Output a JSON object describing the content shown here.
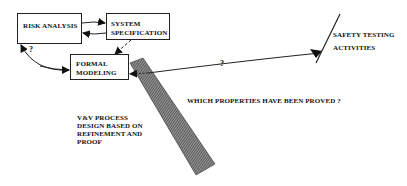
{
  "diagram": {
    "nodes": {
      "risk_analysis": {
        "label": "RISK ANALYSIS"
      },
      "system_specification": {
        "line1": "SYSTEM",
        "line2": "SPECIFICATION"
      },
      "formal_modeling": {
        "line1": "FORMAL",
        "line2": "MODELING"
      }
    },
    "safety_testing": {
      "line1": "SAFETY TESTING",
      "line2": "ACTIVITIES"
    },
    "vv_process": {
      "lines": [
        "V&V PROCESS",
        "DESIGN BASED ON",
        "REFINEMENT AND",
        "PROOF"
      ]
    },
    "question_label": "WHICH PROPERTIES HAVE BEEN PROVED ?",
    "edge_labels": {
      "risk_to_formal": "?",
      "safety_to_formal": "?"
    },
    "colors": {
      "stroke": "#222222",
      "hatch_dark": "#333333",
      "hatch_light": "#9a9a9a",
      "background": "#ffffff"
    }
  }
}
